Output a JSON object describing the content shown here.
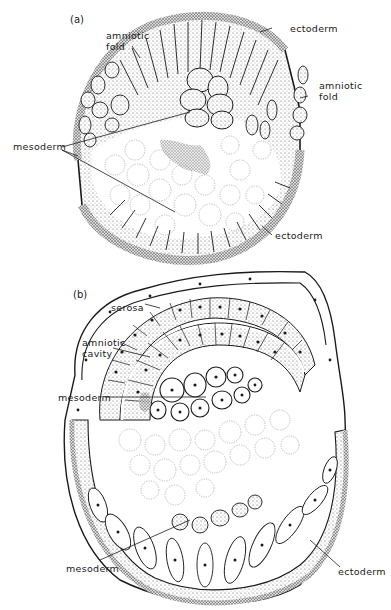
{
  "figure": {
    "panel_a": {
      "label": "(a)",
      "annotations": {
        "amniotic_fold_left": [
          "amniotic",
          "fold"
        ],
        "ectoderm_top": "ectoderm",
        "amniotic_fold_right": [
          "amniotic",
          "fold"
        ],
        "mesoderm": "mesoderm",
        "ectoderm_bottom": "ectoderm"
      }
    },
    "panel_b": {
      "label": "(b)",
      "annotations": {
        "serosa": "serosa",
        "amniotic_cavity": [
          "amniotic",
          "cavity"
        ],
        "mesoderm_mid": "mesoderm",
        "mesoderm_bottom": "mesoderm",
        "ectoderm_bottom": "ectoderm"
      }
    },
    "colors": {
      "ink": "#1a1a1a",
      "stipple": "#6b6b6b",
      "yolk": "#b0b0b0",
      "background": "#ffffff"
    }
  }
}
